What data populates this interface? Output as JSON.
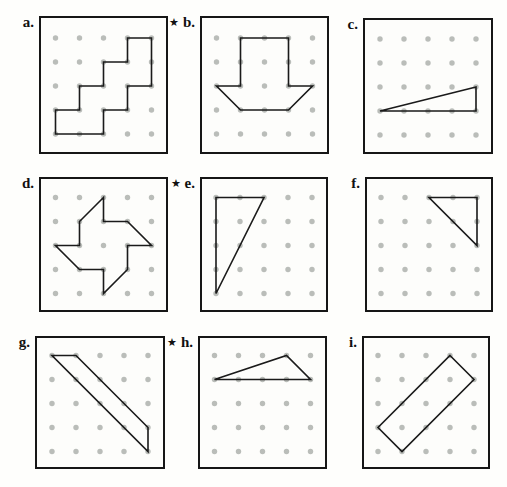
{
  "figure": {
    "star_glyph": "★",
    "grid": {
      "rows": 5,
      "cols": 5
    },
    "colors": {
      "dot": "#a9ada9",
      "line": "#1a1a1a",
      "border": "#161616",
      "background": "#fdfdfb"
    },
    "panels": [
      {
        "label": "a.",
        "starred": false,
        "shape": "staircase",
        "vertices": [
          [
            3,
            0
          ],
          [
            4,
            0
          ],
          [
            4,
            2
          ],
          [
            3,
            2
          ],
          [
            3,
            3
          ],
          [
            2,
            3
          ],
          [
            2,
            4
          ],
          [
            0,
            4
          ],
          [
            0,
            3
          ],
          [
            1,
            3
          ],
          [
            1,
            2
          ],
          [
            2,
            2
          ],
          [
            2,
            1
          ],
          [
            3,
            1
          ]
        ]
      },
      {
        "label": "b.",
        "starred": true,
        "shape": "down-arrow",
        "vertices": [
          [
            1,
            0
          ],
          [
            3,
            0
          ],
          [
            3,
            2
          ],
          [
            4,
            2
          ],
          [
            3,
            3
          ],
          [
            1,
            3
          ],
          [
            0,
            2
          ],
          [
            1,
            2
          ]
        ]
      },
      {
        "label": "c.",
        "starred": false,
        "shape": "thin-right-triangle",
        "vertices": [
          [
            0,
            3
          ],
          [
            4,
            2
          ],
          [
            4,
            3
          ]
        ]
      },
      {
        "label": "d.",
        "starred": false,
        "shape": "pinwheel",
        "vertices": [
          [
            2,
            0
          ],
          [
            1,
            1
          ],
          [
            1,
            2
          ],
          [
            0,
            2
          ],
          [
            1,
            3
          ],
          [
            2,
            3
          ],
          [
            2,
            4
          ],
          [
            3,
            3
          ],
          [
            3,
            2
          ],
          [
            4,
            2
          ],
          [
            3,
            1
          ],
          [
            2,
            1
          ]
        ]
      },
      {
        "label": "e.",
        "starred": true,
        "shape": "tall-right-triangle",
        "vertices": [
          [
            0,
            0
          ],
          [
            2,
            0
          ],
          [
            0,
            4
          ]
        ]
      },
      {
        "label": "f.",
        "starred": false,
        "shape": "right-triangle",
        "vertices": [
          [
            2,
            0
          ],
          [
            4,
            0
          ],
          [
            4,
            2
          ]
        ]
      },
      {
        "label": "g.",
        "starred": false,
        "shape": "diagonal-parallelogram",
        "vertices": [
          [
            0,
            0
          ],
          [
            1,
            0
          ],
          [
            4,
            3
          ],
          [
            4,
            4
          ]
        ]
      },
      {
        "label": "h.",
        "starred": true,
        "shape": "obtuse-triangle",
        "vertices": [
          [
            0,
            1
          ],
          [
            3,
            0
          ],
          [
            4,
            1
          ]
        ]
      },
      {
        "label": "i.",
        "starred": false,
        "shape": "tilted-rectangle",
        "vertices": [
          [
            3,
            0
          ],
          [
            4,
            1
          ],
          [
            1,
            4
          ],
          [
            0,
            3
          ]
        ]
      }
    ]
  }
}
